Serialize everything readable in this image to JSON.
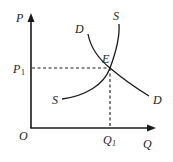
{
  "diagram": {
    "type": "supply-demand",
    "axes": {
      "y_label": "P",
      "x_label": "Q",
      "origin_label": "O"
    },
    "curves": {
      "supply": {
        "label_top": "S",
        "label_bottom": "S"
      },
      "demand": {
        "label_top": "D",
        "label_bottom": "D"
      }
    },
    "equilibrium": {
      "point_label": "E",
      "price_label": "P",
      "price_subscript": "1",
      "quantity_label": "Q",
      "quantity_subscript": "1"
    },
    "colors": {
      "ink": "#1a1a1a",
      "background": "#ffffff"
    }
  }
}
